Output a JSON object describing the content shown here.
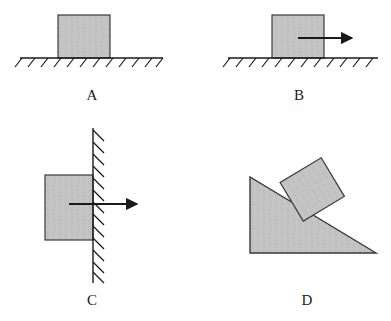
{
  "figure": {
    "background_color": "#ffffff",
    "block_fill_color": "#c3c3c3",
    "line_color": "#1a1a1a",
    "panel_count": 4
  },
  "panels": [
    {
      "id": "A",
      "label": "A",
      "label_x": 92,
      "label_y": 100,
      "description": "Block resting on horizontal hatched ground, no applied force",
      "surface": {
        "type": "horizontal-ground",
        "x1": 20,
        "y1": 58,
        "x2": 163,
        "y2": 58,
        "hatch_count": 11,
        "hatch_length": 9,
        "hatch_angle_deg": 45
      },
      "block": {
        "shape": "rectangle",
        "x": 58,
        "y": 15,
        "width": 52,
        "height": 43,
        "rotation_deg": 0
      },
      "arrow": null
    },
    {
      "id": "B",
      "label": "B",
      "label_x": 299,
      "label_y": 100,
      "description": "Block on horizontal hatched ground with horizontal applied force to the right",
      "surface": {
        "type": "horizontal-ground",
        "x1": 228,
        "y1": 58,
        "x2": 378,
        "y2": 58,
        "hatch_count": 12,
        "hatch_length": 9,
        "hatch_angle_deg": 45
      },
      "block": {
        "shape": "rectangle",
        "x": 272,
        "y": 15,
        "width": 52,
        "height": 43,
        "rotation_deg": 0
      },
      "arrow": {
        "x1": 298,
        "y1": 38,
        "x2": 355,
        "y2": 38,
        "direction": "right",
        "head_length": 11,
        "head_width": 9
      }
    },
    {
      "id": "C",
      "label": "C",
      "label_x": 92,
      "label_y": 305,
      "description": "Block pressed against a vertical hatched wall by a horizontal force to the right",
      "surface": {
        "type": "vertical-wall",
        "x1": 93,
        "y1": 128,
        "x2": 93,
        "y2": 283,
        "hatch_count": 13,
        "hatch_length": 11,
        "hatch_angle_deg": 45
      },
      "block": {
        "shape": "rectangle",
        "x": 45,
        "y": 175,
        "width": 48,
        "height": 65,
        "rotation_deg": 0
      },
      "arrow": {
        "x1": 69,
        "y1": 204,
        "x2": 140,
        "y2": 204,
        "direction": "right",
        "head_length": 12,
        "head_width": 10
      }
    },
    {
      "id": "D",
      "label": "D",
      "label_x": 307,
      "label_y": 305,
      "description": "Block resting on the slope of a right-triangular inclined wedge",
      "surface": {
        "type": "inclined-wedge",
        "apex_x": 250,
        "apex_y": 177,
        "bottom_left_x": 250,
        "bottom_left_y": 253,
        "bottom_right_x": 376,
        "bottom_right_y": 253,
        "incline_angle_deg": 31
      },
      "block": {
        "shape": "rectangle",
        "center_x": 312,
        "center_y": 189,
        "width": 48,
        "height": 45,
        "rotation_deg": -31
      },
      "arrow": null
    }
  ]
}
